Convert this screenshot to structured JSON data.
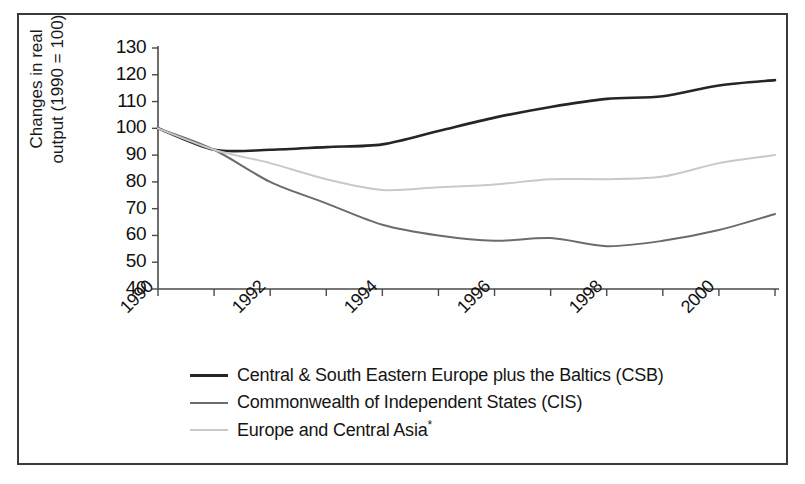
{
  "chart_data": {
    "type": "line",
    "title": "",
    "xlabel": "",
    "ylabel": "Changes in real output (1990 = 100)",
    "ylabel_line1": "Changes in real",
    "ylabel_line2": "output (1990 = 100)",
    "x": [
      1990,
      1991,
      1992,
      1993,
      1994,
      1995,
      1996,
      1997,
      1998,
      1999,
      2000,
      2001
    ],
    "xlim": [
      1990,
      2001
    ],
    "ylim": [
      40,
      130
    ],
    "yticks": [
      130,
      120,
      110,
      100,
      90,
      80,
      70,
      60,
      50,
      40
    ],
    "xticks": [
      1990,
      1991,
      1992,
      1993,
      1994,
      1995,
      1996,
      1997,
      1998,
      1999,
      2000,
      2001
    ],
    "xtick_labels_shown": [
      "1990",
      "1992",
      "1994",
      "1996",
      "1998",
      "2000"
    ],
    "grid": false,
    "legend_position": "bottom",
    "series": [
      {
        "name": "Central & South Eastern Europe plus the Baltics (CSB)",
        "short": "CSB",
        "color": "#252525",
        "width": 2.6,
        "values": [
          100,
          92,
          92,
          93,
          94,
          99,
          104,
          108,
          111,
          112,
          116,
          118
        ]
      },
      {
        "name": "Commonwealth of Independent States (CIS)",
        "short": "CIS",
        "color": "#6b6b6b",
        "width": 2.0,
        "values": [
          100,
          92,
          80,
          72,
          64,
          60,
          58,
          59,
          56,
          58,
          62,
          68
        ]
      },
      {
        "name": "Europe and Central Asia*",
        "short": "ECA",
        "color": "#c8c8c8",
        "width": 2.0,
        "values": [
          100,
          92,
          87,
          81,
          77,
          78,
          79,
          81,
          81,
          82,
          87,
          90
        ]
      }
    ],
    "annotations": [
      "*"
    ]
  },
  "legend": {
    "items": [
      {
        "label": "Central & South Eastern Europe plus the Baltics (CSB)",
        "color": "#252525"
      },
      {
        "label": "Commonwealth of Independent States (CIS)",
        "color": "#6b6b6b"
      },
      {
        "label": "Europe and Central Asia",
        "color": "#c8c8c8",
        "suffix": "*"
      }
    ]
  },
  "axis": {
    "y_labels": [
      "130",
      "120",
      "110",
      "100",
      "90",
      "80",
      "70",
      "60",
      "50",
      "40"
    ],
    "x_labels": [
      "1990",
      "1992",
      "1994",
      "1996",
      "1998",
      "2000"
    ]
  },
  "colors": {
    "frame": "#3a3a3a",
    "axis": "#4a4a4a",
    "text": "#111111",
    "background": "#ffffff"
  }
}
